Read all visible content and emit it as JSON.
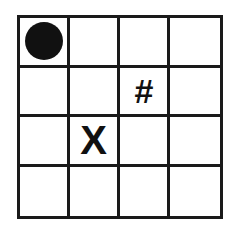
{
  "board": {
    "rows": 4,
    "cols": 4,
    "cells": [
      [
        {
          "piece": "circle",
          "label": ""
        },
        {
          "piece": "",
          "label": ""
        },
        {
          "piece": "",
          "label": ""
        },
        {
          "piece": "",
          "label": ""
        }
      ],
      [
        {
          "piece": "",
          "label": ""
        },
        {
          "piece": "",
          "label": ""
        },
        {
          "piece": "hash",
          "label": "#"
        },
        {
          "piece": "",
          "label": ""
        }
      ],
      [
        {
          "piece": "",
          "label": ""
        },
        {
          "piece": "x",
          "label": "X"
        },
        {
          "piece": "",
          "label": ""
        },
        {
          "piece": "",
          "label": ""
        }
      ],
      [
        {
          "piece": "",
          "label": ""
        },
        {
          "piece": "",
          "label": ""
        },
        {
          "piece": "",
          "label": ""
        },
        {
          "piece": "",
          "label": ""
        }
      ]
    ]
  },
  "colors": {
    "grid_line": "#1a1a1a",
    "piece": "#111111",
    "background": "#ffffff"
  }
}
